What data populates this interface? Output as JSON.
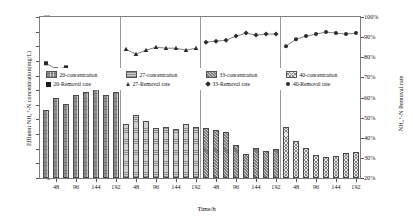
{
  "chart_data": {
    "type": "bar",
    "title": "",
    "xlabel": "Time/h",
    "ylabel": "Effluent NH4+-N concentration(mg/L)",
    "ylabel_secondary": "NH4+-N Removal rate",
    "ylim": [
      0,
      22
    ],
    "ylim_secondary": [
      20,
      100
    ],
    "ytick_labels": [
      "0",
      "2",
      "4",
      "6",
      "8",
      "10",
      "12",
      "14",
      "16",
      "18",
      "20",
      "22"
    ],
    "ytick_values": [
      0,
      2,
      4,
      6,
      8,
      10,
      12,
      14,
      16,
      18,
      20,
      22
    ],
    "ytick_labels_secondary": [
      "20%",
      "30%",
      "40%",
      "50%",
      "60%",
      "70%",
      "80%",
      "90%",
      "100%"
    ],
    "ytick_values_secondary": [
      20,
      30,
      40,
      50,
      60,
      70,
      80,
      90,
      100
    ],
    "x": [
      24,
      48,
      72,
      96,
      120,
      144,
      168,
      192
    ],
    "xtick_labels": [
      "48",
      "96",
      "144",
      "192"
    ],
    "grid": false,
    "legend_position": "upper-center",
    "groups": [
      {
        "name": "20",
        "bar_legend": "20-concentration",
        "line_legend": "20-Removal rate",
        "marker": "square",
        "concentration": [
          9.3,
          10.9,
          10.1,
          11.3,
          11.8,
          12.1,
          11.4,
          11.7
        ],
        "removal_rate": [
          77.0,
          74.0,
          75.0,
          72.5,
          71.0,
          70.5,
          72.0,
          71.5
        ]
      },
      {
        "name": "27",
        "bar_legend": "27-concentration",
        "line_legend": "27-Removal rate",
        "marker": "triangle",
        "concentration": [
          7.4,
          8.6,
          7.8,
          6.9,
          7.0,
          6.7,
          7.4,
          7.0
        ],
        "removal_rate": [
          84.0,
          81.5,
          83.5,
          85.0,
          84.5,
          84.5,
          83.5,
          84.5
        ]
      },
      {
        "name": "33",
        "bar_legend": "33-concentration",
        "line_legend": "33-Removal rate",
        "marker": "diamond",
        "concentration": [
          6.9,
          6.6,
          6.3,
          4.5,
          3.3,
          4.1,
          3.7,
          3.9
        ],
        "removal_rate": [
          87.5,
          88.0,
          88.5,
          90.5,
          92.0,
          91.0,
          91.5,
          91.5
        ]
      },
      {
        "name": "40",
        "bar_legend": "40-concentration",
        "line_legend": "40-Removal rate",
        "marker": "circle",
        "concentration": [
          7.0,
          5.1,
          4.1,
          3.1,
          2.9,
          3.0,
          3.4,
          3.5
        ],
        "removal_rate": [
          85.5,
          89.0,
          90.5,
          91.5,
          92.5,
          92.0,
          91.5,
          92.0
        ]
      }
    ]
  },
  "legend": {
    "items": [
      {
        "bar": "20-concentration",
        "line": "20-Removal rate"
      },
      {
        "bar": "27-concentration",
        "line": "27-Removal rate"
      },
      {
        "bar": "33-concentration",
        "line": "33-Removal rate"
      },
      {
        "bar": "40-concentration",
        "line": "40-Removal rate"
      }
    ]
  },
  "axes": {
    "left_title": "Effluent NH₄⁺-N concentration(mg/L)",
    "right_title": "NH₄⁺-N Removal rate",
    "x_title": "Time/h"
  }
}
